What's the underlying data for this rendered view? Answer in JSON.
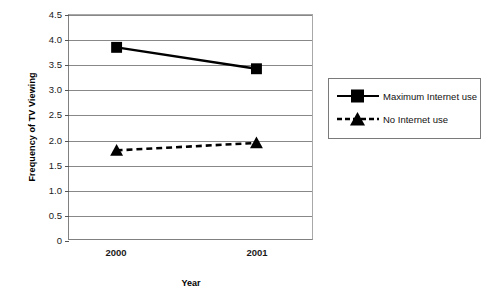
{
  "chart_data": {
    "type": "line",
    "title": "",
    "xlabel": "Year",
    "ylabel": "Frequency of TV Viewing",
    "categories": [
      "2000",
      "2001"
    ],
    "x": [
      2000,
      2001
    ],
    "ylim": [
      0,
      4.5
    ],
    "yticks": [
      "0",
      "0.5",
      "1.0",
      "1.5",
      "2.0",
      "2.5",
      "3.0",
      "3.5",
      "4.0",
      "4.5"
    ],
    "ytick_values": [
      0,
      0.5,
      1.0,
      1.5,
      2.0,
      2.5,
      3.0,
      3.5,
      4.0,
      4.5
    ],
    "grid": "horizontal",
    "legend_position": "right",
    "series": [
      {
        "name": "Maximum Internet use",
        "values": [
          3.85,
          3.42
        ],
        "marker": "square",
        "linestyle": "solid",
        "color": "#000000"
      },
      {
        "name": "No Internet use",
        "values": [
          1.78,
          1.93
        ],
        "marker": "triangle",
        "linestyle": "dashed",
        "color": "#000000"
      }
    ]
  },
  "axes": {
    "y_title": "Frequency of TV Viewing",
    "x_title": "Year",
    "ytick_labels": [
      "4.5",
      "4.0",
      "3.5",
      "3.0",
      "2.5",
      "2.0",
      "1.5",
      "1.0",
      "0.5",
      "0"
    ],
    "xtick_labels": [
      "2000",
      "2001"
    ]
  },
  "legend": {
    "items": [
      {
        "label": "Maximum Internet use",
        "marker": "square-marker",
        "line": "solid"
      },
      {
        "label": "No Internet use",
        "marker": "triangle-marker",
        "line": "dashed"
      }
    ]
  },
  "colors": {
    "series": "#000000",
    "gridline": "#888888",
    "axis": "#808080",
    "background": "#ffffff"
  }
}
